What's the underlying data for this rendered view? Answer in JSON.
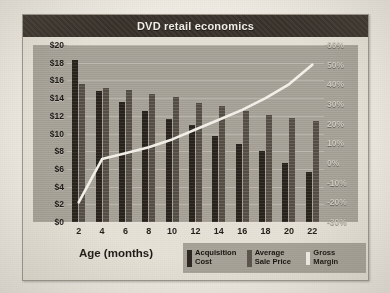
{
  "chart_title": "DVD retail economics",
  "xlabel": "Age (months)",
  "y_left_ticks": [
    "$20",
    "$18",
    "$16",
    "$14",
    "$12",
    "$10",
    "$8",
    "$6",
    "$4",
    "$2",
    "$0"
  ],
  "y_right_ticks": [
    "60%",
    "50%",
    "40%",
    "30%",
    "20%",
    "10%",
    "0%",
    "-10%",
    "-20%",
    "-30%"
  ],
  "legend": [
    {
      "label_line1": "Acquisition",
      "label_line2": "Cost",
      "color": "#2e2721",
      "icon": "bar-swatch-dark"
    },
    {
      "label_line1": "Average",
      "label_line2": "Sale Price",
      "color": "#5d564d",
      "icon": "bar-swatch-gray"
    },
    {
      "label_line1": "Gross",
      "label_line2": "Margin",
      "color": "#f4f1ea",
      "icon": "line-swatch-white"
    }
  ],
  "chart_data": {
    "type": "bar",
    "title": "DVD retail economics",
    "xlabel": "Age (months)",
    "ylabel": "",
    "categories": [
      "2",
      "4",
      "6",
      "8",
      "10",
      "12",
      "14",
      "16",
      "18",
      "20",
      "22"
    ],
    "ylim": [
      0,
      20
    ],
    "y2lim": [
      -30,
      60
    ],
    "grid": true,
    "legend_position": "bottom-right",
    "series": [
      {
        "name": "Acquisition Cost",
        "type": "bar",
        "axis": "left",
        "color": "#2e2721",
        "values": [
          18.3,
          14.8,
          13.6,
          12.6,
          11.6,
          11.0,
          9.7,
          8.8,
          8.0,
          6.7,
          5.7
        ]
      },
      {
        "name": "Average Sale Price",
        "type": "bar",
        "axis": "left",
        "color": "#5d564d",
        "values": [
          15.6,
          15.1,
          14.9,
          14.5,
          14.1,
          13.4,
          13.1,
          12.5,
          12.1,
          11.7,
          11.4
        ]
      },
      {
        "name": "Gross Margin",
        "type": "line",
        "axis": "right",
        "color": "#f4f1ea",
        "values": [
          -20,
          2,
          5,
          8,
          12,
          17,
          22,
          27,
          33,
          40,
          50
        ]
      }
    ]
  }
}
